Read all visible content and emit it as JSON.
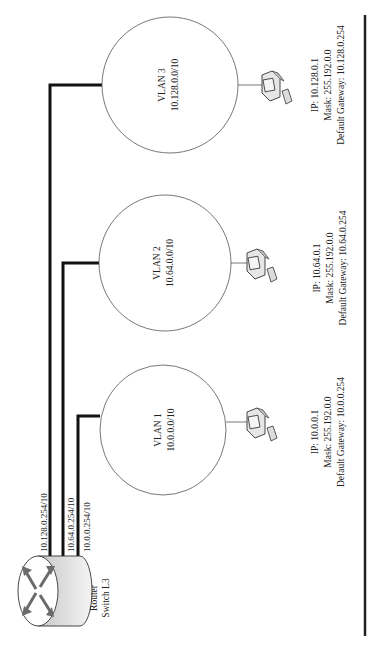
{
  "diagram": {
    "orientation": "rotated 90 degrees counter-clockwise",
    "router": {
      "label_line1": "Router",
      "label_line2": "Switch L3",
      "interfaces": [
        {
          "ip": "10.128.0.254/10",
          "vlan": "VLAN 3"
        },
        {
          "ip": "10.64.0.254/10",
          "vlan": "VLAN 2"
        },
        {
          "ip": "10.0.0.254/10",
          "vlan": "VLAN 1"
        }
      ]
    },
    "vlans": [
      {
        "name": "VLAN 1",
        "network": "10.0.0.0/10"
      },
      {
        "name": "VLAN 2",
        "network": "10.64.0.0/10"
      },
      {
        "name": "VLAN 3",
        "network": "10.128.0.0/10"
      }
    ],
    "hosts": [
      {
        "ip": "IP: 10.0.0.1",
        "mask": "Mask: 255.192.0.0",
        "gateway": "Default Gateway: 10.0.0.254"
      },
      {
        "ip": "IP: 10.64.0.1",
        "mask": "Mask: 255.192.0.0",
        "gateway": "Default Gateway: 10.64.0.254"
      },
      {
        "ip": "IP: 10.128.0.1",
        "mask": "Mask: 255.192.0.0",
        "gateway": "Default Gateway: 10.128.0.254"
      }
    ]
  },
  "colors": {
    "line": "#111111",
    "circle_stroke": "#555555",
    "router_fill": "#d9d9d9",
    "arrow": "#6b6b6b"
  }
}
